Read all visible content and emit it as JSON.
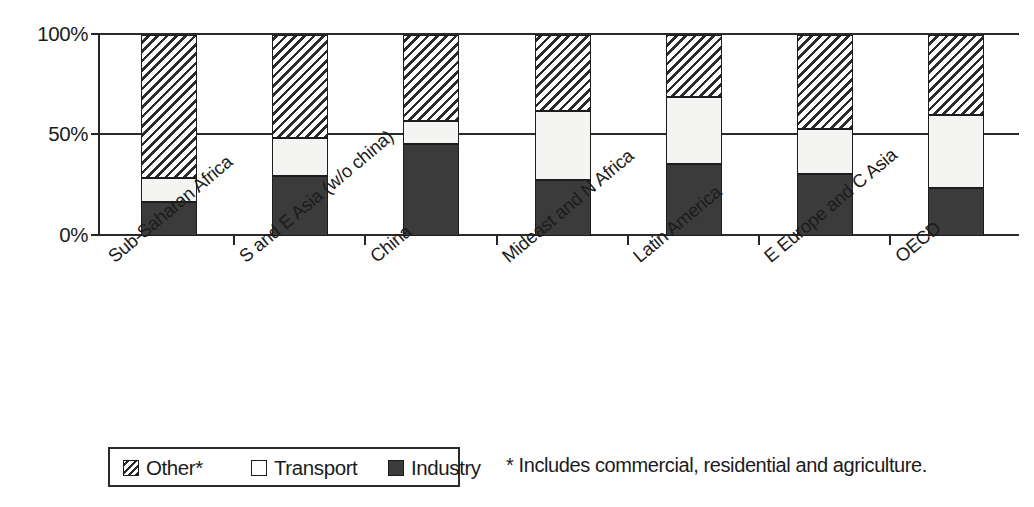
{
  "chart_data": {
    "type": "bar",
    "stacked": true,
    "normalized_percent": true,
    "title": "",
    "xlabel": "",
    "ylabel": "",
    "ylim": [
      0,
      100
    ],
    "ytick_labels": [
      "0%",
      "50%",
      "100%"
    ],
    "ytick_values": [
      0,
      50,
      100
    ],
    "grid": true,
    "legend_position": "bottom-left",
    "categories": [
      "Sub-Saharan Africa",
      "S and E Asia (w/o china)",
      "China",
      "Mideast and N Africa",
      "Latin America",
      "E Europe and C Asia",
      "OECD"
    ],
    "series": [
      {
        "name": "Industry",
        "values": [
          17,
          30,
          46,
          28,
          36,
          31,
          24
        ]
      },
      {
        "name": "Transport",
        "values": [
          12,
          19,
          11,
          34,
          33,
          22,
          36
        ]
      },
      {
        "name": "Other*",
        "values": [
          71,
          51,
          43,
          38,
          31,
          47,
          40
        ]
      }
    ],
    "annotations": [
      "* Includes commercial, residential and agriculture."
    ]
  },
  "axis": {
    "y_labels": {
      "top": "100%",
      "mid": "50%",
      "bottom": "0%"
    }
  },
  "legend": {
    "items": [
      {
        "label": "Other*",
        "pattern": "hatched-diagonal",
        "color": "#2b2b2b"
      },
      {
        "label": "Transport",
        "pattern": "solid-white",
        "color": "#ffffff"
      },
      {
        "label": "Industry",
        "pattern": "solid-dark",
        "color": "#3b3b3b"
      }
    ]
  },
  "footnote": {
    "text": "* Includes commercial, residential and agriculture."
  }
}
